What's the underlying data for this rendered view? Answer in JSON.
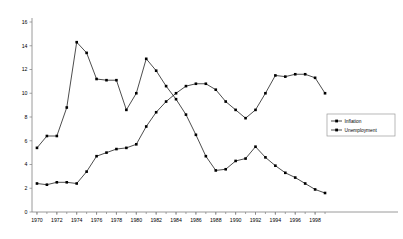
{
  "chart_data": {
    "type": "line",
    "title": "",
    "subtitle": "",
    "xlabel": "",
    "ylabel": "",
    "xlim": [
      1969.5,
      1999.5
    ],
    "ylim": [
      0,
      16
    ],
    "grid": false,
    "legend_position": "right-middle",
    "x": [
      1970,
      1971,
      1972,
      1973,
      1974,
      1975,
      1976,
      1977,
      1978,
      1979,
      1980,
      1981,
      1982,
      1983,
      1984,
      1985,
      1986,
      1987,
      1988,
      1989,
      1990,
      1991,
      1992,
      1993,
      1994,
      1995,
      1996,
      1997,
      1998,
      1999
    ],
    "xticks": [
      1970,
      1972,
      1974,
      1976,
      1978,
      1980,
      1982,
      1984,
      1986,
      1988,
      1990,
      1992,
      1994,
      1996,
      1998
    ],
    "xtick_labels": [
      "1970",
      "1972",
      "1974",
      "1976",
      "1978",
      "1980",
      "1982",
      "1984",
      "1986",
      "1988",
      "1990",
      "1992",
      "1994",
      "1996",
      "1998"
    ],
    "yticks": [
      0,
      2,
      4,
      6,
      8,
      10,
      12,
      14,
      16
    ],
    "ytick_labels": [
      "0",
      "2",
      "4",
      "6",
      "8",
      "10",
      "12",
      "14",
      "16"
    ],
    "series": [
      {
        "name": "Inflation",
        "marker": "square",
        "color": "#000000",
        "values": [
          5.4,
          6.4,
          6.4,
          8.8,
          14.3,
          13.4,
          11.2,
          11.1,
          11.1,
          8.6,
          10.0,
          12.9,
          11.9,
          10.6,
          9.5,
          8.2,
          6.5,
          4.7,
          3.5,
          3.6,
          4.3,
          4.5,
          5.5,
          4.6,
          3.9,
          3.3,
          2.9,
          2.4,
          1.9,
          1.6
        ]
      },
      {
        "name": "Unemployment",
        "marker": "square",
        "color": "#000000",
        "values": [
          2.4,
          2.3,
          2.5,
          2.5,
          2.4,
          3.4,
          4.7,
          5.0,
          5.3,
          5.4,
          5.7,
          7.2,
          8.4,
          9.3,
          10.0,
          10.6,
          10.8,
          10.8,
          10.3,
          9.3,
          8.6,
          7.9,
          8.6,
          10.0,
          11.5,
          11.4,
          11.6,
          11.6,
          11.3,
          10.0
        ]
      }
    ]
  },
  "legend": {
    "entries": [
      {
        "label": "Inflation"
      },
      {
        "label": "Unemployment"
      }
    ]
  }
}
